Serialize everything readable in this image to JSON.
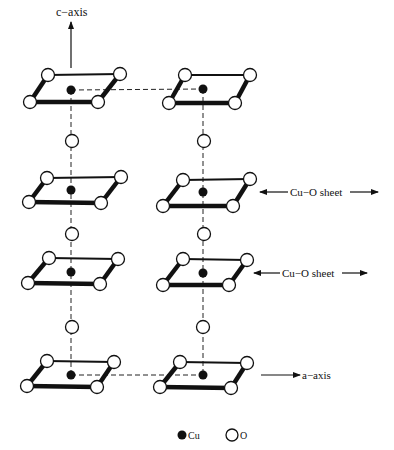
{
  "figure": {
    "labels": {
      "c_axis": "c−axis",
      "a_axis": "a−axis",
      "sheet_1": "Cu−O sheet",
      "sheet_2": "Cu−O sheet"
    },
    "legend": {
      "cu": {
        "label": "Cu",
        "symbol": "filled-circle"
      },
      "o": {
        "label": "O",
        "symbol": "open-circle"
      }
    },
    "colors": {
      "ink": "#111111",
      "background": "#ffffff"
    },
    "structure": {
      "columns": 2,
      "layers_per_column": 4,
      "layers_top_to_bottom": [
        "CuO4 plaquette",
        "CuO4 plaquette (Cu-O sheet)",
        "CuO4 plaquette (Cu-O sheet)",
        "CuO4 plaquette"
      ],
      "apical_oxygens_between_layers": true,
      "dashed_links": [
        "top Cu-Cu horizontal",
        "bottom Cu-Cu horizontal",
        "vertical Cu-O-Cu chains"
      ]
    }
  }
}
